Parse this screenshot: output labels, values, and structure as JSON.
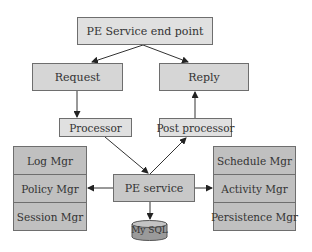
{
  "diagram": {
    "nodes": {
      "endpoint": "PE Service end point",
      "request": "Request",
      "reply": "Reply",
      "processor": "Processor",
      "post_processor": "Post processor",
      "service": "PE service",
      "database": "My SQL"
    },
    "left_stack": [
      "Log Mgr",
      "Policy Mgr",
      "Session Mgr"
    ],
    "right_stack": [
      "Schedule Mgr",
      "Activity Mgr",
      "Persistence Mgr"
    ],
    "edges": [
      {
        "from": "PE Service end point",
        "to": "Request"
      },
      {
        "from": "PE Service end point",
        "to": "Reply"
      },
      {
        "from": "Request",
        "to": "Processor"
      },
      {
        "from": "Post processor",
        "to": "Reply"
      },
      {
        "from": "Processor",
        "to": "PE service"
      },
      {
        "from": "PE service",
        "to": "Post processor"
      },
      {
        "from": "PE service",
        "to": "Policy Mgr"
      },
      {
        "from": "PE service",
        "to": "Activity Mgr"
      },
      {
        "from": "PE service",
        "to": "My SQL"
      }
    ],
    "colors": {
      "box_fill": "#d6d6d6",
      "stack_fill": "#c0c0c0",
      "border": "#6e6e6e",
      "line": "#333333"
    }
  }
}
